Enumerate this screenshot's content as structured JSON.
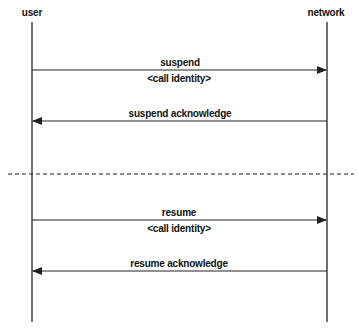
{
  "participants": {
    "user": "user",
    "network": "network"
  },
  "messages": [
    {
      "label": "suspend",
      "param": "<call identity>",
      "direction": "user-to-network"
    },
    {
      "label": "suspend acknowledge",
      "direction": "network-to-user"
    },
    {
      "label": "resume",
      "param": "<call identity>",
      "direction": "user-to-network"
    },
    {
      "label": "resume acknowledge",
      "direction": "network-to-user"
    }
  ],
  "colors": {
    "line": "#222222",
    "background": "#ffffff"
  }
}
